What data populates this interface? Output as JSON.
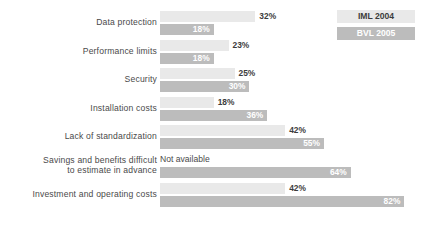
{
  "chart_data": {
    "type": "bar",
    "orientation": "horizontal",
    "title": "",
    "subtitle": "",
    "xlabel": "",
    "ylabel": "",
    "grid": false,
    "xlim": [
      0,
      90
    ],
    "legend_position": "top-right",
    "categories": [
      "Data protection",
      "Performance limits",
      "Security",
      "Installation costs",
      "Lack of standardization",
      "Savings and benefits difficult to estimate in advance",
      "Investment and operating costs"
    ],
    "series": [
      {
        "name": "IML 2004",
        "color": "#e9e9e9",
        "label_color": "#3c3c3c",
        "values": [
          32,
          23,
          25,
          18,
          42,
          null,
          42
        ],
        "value_labels": [
          "32%",
          "23%",
          "25%",
          "18%",
          "42%",
          "Not available",
          "42%"
        ]
      },
      {
        "name": "BVL 2005",
        "color": "#bcbcbc",
        "label_color": "#ffffff",
        "values": [
          18,
          18,
          30,
          36,
          55,
          64,
          82
        ],
        "value_labels": [
          "18%",
          "18%",
          "30%",
          "36%",
          "55%",
          "64%",
          "82%"
        ]
      }
    ]
  },
  "rows": [
    {
      "label_line1": "Data protection",
      "label_line2": "",
      "iml_value": 32,
      "iml_label": "32%",
      "iml_available": true,
      "bvl_value": 18,
      "bvl_label": "18%"
    },
    {
      "label_line1": "Performance limits",
      "label_line2": "",
      "iml_value": 23,
      "iml_label": "23%",
      "iml_available": true,
      "bvl_value": 18,
      "bvl_label": "18%"
    },
    {
      "label_line1": "Security",
      "label_line2": "",
      "iml_value": 25,
      "iml_label": "25%",
      "iml_available": true,
      "bvl_value": 30,
      "bvl_label": "30%"
    },
    {
      "label_line1": "Installation costs",
      "label_line2": "",
      "iml_value": 18,
      "iml_label": "18%",
      "iml_available": true,
      "bvl_value": 36,
      "bvl_label": "36%"
    },
    {
      "label_line1": "Lack of standardization",
      "label_line2": "",
      "iml_value": 42,
      "iml_label": "42%",
      "iml_available": true,
      "bvl_value": 55,
      "bvl_label": "55%"
    },
    {
      "label_line1": "Savings and benefits difficult",
      "label_line2": "to estimate in advance",
      "iml_value": 0,
      "iml_label": "Not available",
      "iml_available": false,
      "bvl_value": 64,
      "bvl_label": "64%"
    },
    {
      "label_line1": "Investment and operating costs",
      "label_line2": "",
      "iml_value": 42,
      "iml_label": "42%",
      "iml_available": true,
      "bvl_value": 82,
      "bvl_label": "82%"
    }
  ],
  "legend": {
    "items": [
      {
        "label": "IML 2004",
        "color": "#e9e9e9"
      },
      {
        "label": "BVL 2005",
        "color": "#bcbcbc"
      }
    ]
  },
  "scale": {
    "px_per_percent": 2.98,
    "bar_origin_x": 160
  }
}
